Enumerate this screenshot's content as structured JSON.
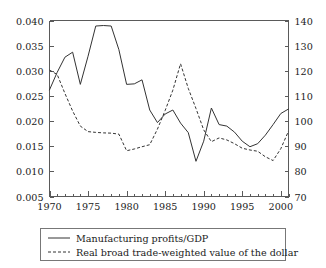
{
  "chart_data": {
    "type": "line",
    "title": "",
    "subtitle": "",
    "xlabel": "",
    "ylabel": "",
    "grid": false,
    "legend_position": "bottom",
    "xlim": [
      1970,
      2001
    ],
    "xticks": [
      1970,
      1975,
      1980,
      1985,
      1990,
      1995,
      2000
    ],
    "xtick_labels": [
      "1970",
      "1975",
      "1980",
      "1985",
      "1990",
      "1995",
      "2000"
    ],
    "x_minor_tick_step": 1,
    "left_axis": {
      "label": "",
      "ylim": [
        0.005,
        0.04
      ],
      "yticks": [
        0.005,
        0.01,
        0.015,
        0.02,
        0.025,
        0.03,
        0.035,
        0.04
      ],
      "ytick_labels": [
        "0.005",
        "0.010",
        "0.015",
        "0.020",
        "0.025",
        "0.030",
        "0.035",
        "0.040"
      ]
    },
    "right_axis": {
      "label": "",
      "ylim": [
        70,
        140
      ],
      "yticks": [
        70,
        80,
        90,
        100,
        110,
        120,
        130,
        140
      ],
      "ytick_labels": [
        "70",
        "80",
        "90",
        "100",
        "110",
        "120",
        "130",
        "140"
      ]
    },
    "x": [
      1970,
      1971,
      1972,
      1973,
      1974,
      1975,
      1976,
      1977,
      1978,
      1979,
      1980,
      1981,
      1982,
      1983,
      1984,
      1985,
      1986,
      1987,
      1988,
      1989,
      1990,
      1991,
      1992,
      1993,
      1994,
      1995,
      1996,
      1997,
      1998,
      1999,
      2000,
      2001
    ],
    "series": [
      {
        "name": "Manufacturing profits/GDP",
        "axis": "left",
        "style": "solid",
        "color": "#333333",
        "values": [
          0.0262,
          0.0297,
          0.0327,
          0.0337,
          0.0273,
          0.0329,
          0.0389,
          0.039,
          0.0389,
          0.0342,
          0.0273,
          0.0274,
          0.0282,
          0.0222,
          0.0197,
          0.0214,
          0.0222,
          0.0196,
          0.0177,
          0.012,
          0.016,
          0.0226,
          0.0193,
          0.019,
          0.0178,
          0.016,
          0.0149,
          0.0155,
          0.0172,
          0.0193,
          0.0215,
          0.0224
        ]
      },
      {
        "name": "Real broad trade-weighted value of the dollar",
        "axis": "right",
        "style": "dashed",
        "color": "#333333",
        "values": [
          120.3,
          118.5,
          111.0,
          104.0,
          98.0,
          95.8,
          95.5,
          95.3,
          95.2,
          94.8,
          88.2,
          88.9,
          89.8,
          90.6,
          96.8,
          104.2,
          112.3,
          122.8,
          113.0,
          105.0,
          96.5,
          91.8,
          93.3,
          92.5,
          91.0,
          89.2,
          88.5,
          88.0,
          85.8,
          84.3,
          89.0,
          96.0
        ]
      }
    ],
    "solid_series_index_note": "",
    "dashed_series_index_note": ""
  },
  "legend": {
    "entries": [
      {
        "label": "Manufacturing profits/GDP",
        "style": "solid"
      },
      {
        "label": "Real broad trade-weighted value of the dollar",
        "style": "dashed"
      }
    ]
  }
}
